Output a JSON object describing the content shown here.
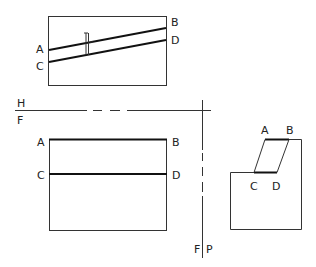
{
  "diagram": {
    "type": "orthographic-projection",
    "top_view": {
      "labels": {
        "left_top": "A",
        "left_bottom": "C",
        "right_top": "B",
        "right_bottom": "D"
      },
      "lines": [
        "AB",
        "CD"
      ],
      "dimension_marker": "thickness"
    },
    "projection_axes": {
      "horizontal_upper_label": "H",
      "horizontal_lower_label": "F",
      "vertical_left_label": "F",
      "vertical_right_label": "P"
    },
    "front_view": {
      "labels": {
        "left_top": "A",
        "left_middle": "C",
        "right_top": "B",
        "right_middle": "D"
      },
      "lines": [
        "AB",
        "CD"
      ]
    },
    "side_view": {
      "labels": {
        "top_left": "A",
        "top_right": "B",
        "bottom_left": "C",
        "bottom_right": "D"
      },
      "lines": [
        "AB",
        "CD",
        "AC",
        "BD"
      ]
    },
    "colors": {
      "line": "#111111",
      "background": "#ffffff"
    }
  }
}
